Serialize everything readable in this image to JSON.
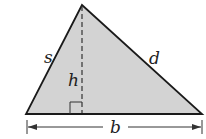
{
  "diagram": {
    "type": "triangle-with-height",
    "labels": {
      "left_side": "s",
      "right_side": "d",
      "height": "h",
      "base": "b"
    },
    "colors": {
      "fill": "#d3d3d3",
      "stroke": "#1a1a1a",
      "background": "#ffffff"
    }
  }
}
